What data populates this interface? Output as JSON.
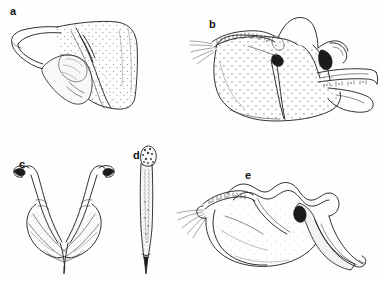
{
  "figure": {
    "type": "scientific-illustration-plate",
    "background_color": "#fefefe",
    "ink_color": "#1b1b1b",
    "width": 379,
    "height": 281,
    "panel_count": 5,
    "panels": [
      {
        "id": "a",
        "label": "a",
        "label_x": 10,
        "label_y": 6,
        "description": "lateral view of genital capsule with broad stippled posterior lobe and slender curved anterior process"
      },
      {
        "id": "b",
        "label": "b",
        "label_x": 209,
        "label_y": 19,
        "description": "lateral view of densely stippled genital capsule with serrate dorsal ridge, inner sclerites and elongate posterior arm"
      },
      {
        "id": "c",
        "label": "c",
        "label_x": 19,
        "label_y": 159,
        "description": "ventral view of paired V-shaped parameres with hooked apices"
      },
      {
        "id": "d",
        "label": "d",
        "label_x": 133,
        "label_y": 150,
        "description": "elongate slender aedeagus with granulate apical head and sharply pointed tip"
      },
      {
        "id": "e",
        "label": "e",
        "label_x": 245,
        "label_y": 170,
        "description": "lateral view of genital capsule with undulate dorsal margin, marginal setae and tapering posterior lobe"
      }
    ]
  }
}
